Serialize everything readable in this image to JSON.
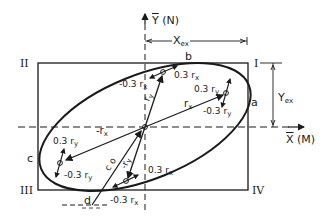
{
  "diagram": {
    "axes": {
      "y_label": "Y",
      "y_label_paren": "(N)",
      "x_label": "X",
      "x_label_paren": "(M)"
    },
    "dimensions": {
      "x_ext": "X",
      "x_ext_sub": "ex",
      "y_ext": "Y",
      "y_ext_sub": "ex"
    },
    "quadrants": [
      "I",
      "II",
      "III",
      "IV"
    ],
    "ellipse_points": [
      "a",
      "b",
      "c",
      "d"
    ],
    "vectors": {
      "rx": "r",
      "rx_sub": "x",
      "neg_rx": "-r",
      "neg_rx_sub": "x",
      "ry": "r",
      "ry_sub": "y",
      "neg_ry": "-r",
      "neg_ry_sub": "y",
      "c0": "c o",
      "p03rx_top": "0.3 r",
      "n03rx_top": "-0.3 r",
      "p03ry_right": "0.3 r",
      "n03ry_right": "-0.3 r",
      "p03ry_left": "0.3 r",
      "n03ry_left": "-0.3 r",
      "p03rx_bot": "0.3 r",
      "n03rx_bot": "-0.3 r",
      "sub_x": "x",
      "sub_y": "y"
    },
    "colors": {
      "ink": "#1a1a1a",
      "background": "#ffffff"
    }
  }
}
